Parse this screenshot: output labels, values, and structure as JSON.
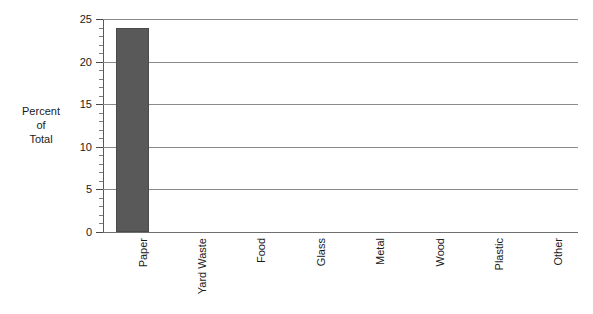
{
  "chart_data": {
    "type": "bar",
    "title": "",
    "subtitle": "",
    "xlabel": "",
    "ylabel": "Percent\nof\nTotal",
    "categories": [
      "Paper",
      "Yard Waste",
      "Food",
      "Glass",
      "Metal",
      "Wood",
      "Plastic",
      "Other"
    ],
    "values": [
      24,
      0,
      0,
      0,
      0,
      0,
      0,
      0
    ],
    "ylim": [
      0,
      25
    ],
    "ytick_labels": [
      "0",
      "5",
      "10",
      "15",
      "20",
      "25"
    ],
    "ytick_values": [
      0,
      5,
      10,
      15,
      20,
      25
    ],
    "minor_tick_interval": 1,
    "grid": "horizontal",
    "legend": "none",
    "bar_color": "#595959",
    "gridline_color": "#8a8a8a",
    "axis_color": "#5a5a5a",
    "background_color": "#ffffff",
    "annotations": []
  }
}
